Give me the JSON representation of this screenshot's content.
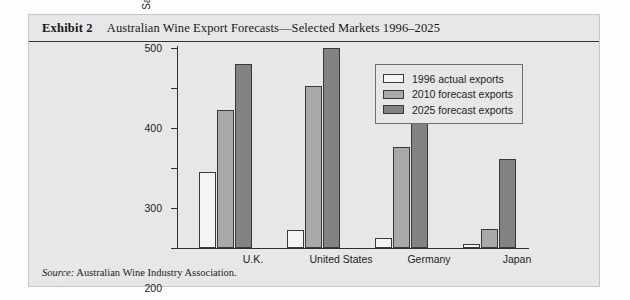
{
  "exhibit": {
    "label": "Exhibit 2",
    "title": "Australian Wine Export Forecasts—Selected Markets 1996–2025",
    "source_word": "Source:",
    "source_text": "Australian Wine Industry Association."
  },
  "chart_data": {
    "type": "bar",
    "title": "Australian Wine Export Forecasts—Selected Markets 1996–2025",
    "xlabel": "",
    "ylabel": "Sales A $millions (1996 values)",
    "categories": [
      "U.K.",
      "United States",
      "Germany",
      "Japan"
    ],
    "series": [
      {
        "name": "1996 actual exports",
        "color": "#f4f4f4",
        "values": [
          190,
          45,
          25,
          10
        ]
      },
      {
        "name": "2010 forecast exports",
        "color": "#a9a9a9",
        "values": [
          345,
          405,
          253,
          48
        ]
      },
      {
        "name": "2025 forecast exports",
        "color": "#828282",
        "values": [
          460,
          500,
          313,
          222
        ]
      }
    ],
    "ylim": [
      0,
      500
    ],
    "yticks": [
      0,
      100,
      200,
      300,
      400,
      500
    ],
    "ytick_labels": [
      "0",
      "100",
      "200",
      "300",
      "400",
      "500"
    ],
    "grid": false,
    "legend_position": "top-right"
  }
}
